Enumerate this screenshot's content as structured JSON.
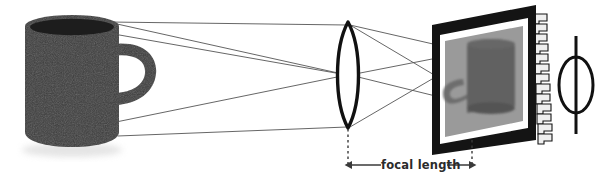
{
  "diagram": {
    "annotation": {
      "focal_length_label": "focal length"
    },
    "objects": {
      "mug": {
        "name": "coffee-mug-object",
        "color": "#3c3c3c",
        "rim_color": "#1d1d1d"
      },
      "lens": {
        "name": "biconvex-lens",
        "color": "#111111"
      },
      "sensor": {
        "name": "image-sensor-chip",
        "frame_color": "#141414",
        "border_color": "#ffffff",
        "image_color": "#9a9a9a"
      },
      "sensor_image": {
        "name": "inverted-mug-image",
        "color": "#5f5f5f"
      },
      "aperture_symbol": {
        "name": "lens-symbol",
        "color": "#111111"
      },
      "rays": {
        "name": "light-rays",
        "color": "#555555"
      },
      "focal_marks": {
        "name": "focal-length-dimension",
        "color": "#3a3a3a"
      }
    }
  }
}
